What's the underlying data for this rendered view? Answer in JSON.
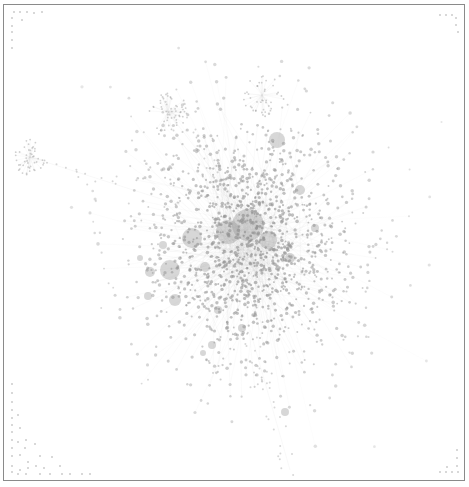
{
  "canvas": {
    "width": 469,
    "height": 487,
    "background": "#ffffff"
  },
  "frame": {
    "x": 3,
    "y": 4,
    "width": 462,
    "height": 477,
    "border_color": "#8a8a8a"
  },
  "style": {
    "node_color": "#9a9a9a",
    "edge_color": "#c8c8c8",
    "hub_color": "#8c8c8c"
  },
  "graph": {
    "type": "force-directed network",
    "main_cluster": {
      "cx": 248,
      "cy": 245,
      "rx": 140,
      "ry": 170,
      "node_count": 1400,
      "seed": 7
    },
    "satellite_clusters": [
      {
        "name": "left-cluster",
        "cx": 30,
        "cy": 157,
        "r": 18,
        "node_count": 45,
        "seed": 11
      },
      {
        "name": "upper-left-cluster",
        "cx": 168,
        "cy": 112,
        "r": 20,
        "node_count": 50,
        "seed": 13
      },
      {
        "name": "top-cluster",
        "cx": 262,
        "cy": 95,
        "r": 22,
        "node_count": 40,
        "seed": 17
      }
    ],
    "hubs": [
      {
        "x": 248,
        "y": 225,
        "r": 16
      },
      {
        "x": 228,
        "y": 232,
        "r": 12
      },
      {
        "x": 192,
        "y": 238,
        "r": 10
      },
      {
        "x": 268,
        "y": 240,
        "r": 9
      },
      {
        "x": 170,
        "y": 270,
        "r": 10
      },
      {
        "x": 150,
        "y": 272,
        "r": 5
      },
      {
        "x": 175,
        "y": 300,
        "r": 6
      },
      {
        "x": 148,
        "y": 296,
        "r": 4
      },
      {
        "x": 277,
        "y": 140,
        "r": 8
      },
      {
        "x": 300,
        "y": 190,
        "r": 5
      },
      {
        "x": 218,
        "y": 310,
        "r": 4
      },
      {
        "x": 242,
        "y": 328,
        "r": 4
      },
      {
        "x": 203,
        "y": 353,
        "r": 3
      },
      {
        "x": 212,
        "y": 345,
        "r": 4
      },
      {
        "x": 285,
        "y": 412,
        "r": 4
      },
      {
        "x": 163,
        "y": 245,
        "r": 4
      },
      {
        "x": 140,
        "y": 258,
        "r": 3
      },
      {
        "x": 290,
        "y": 258,
        "r": 5
      },
      {
        "x": 315,
        "y": 228,
        "r": 4
      },
      {
        "x": 205,
        "y": 267,
        "r": 5
      }
    ],
    "tail_paths": [
      {
        "from": [
          250,
          330
        ],
        "to": [
          290,
          470
        ],
        "count": 35,
        "seed": 23
      },
      {
        "from": [
          30,
          157
        ],
        "to": [
          180,
          205
        ],
        "count": 20,
        "seed": 29
      },
      {
        "from": [
          168,
          112
        ],
        "to": [
          220,
          180
        ],
        "count": 15,
        "seed": 31
      }
    ],
    "isolated_nodes": {
      "top_left": [
        [
          14,
          12
        ],
        [
          20,
          12
        ],
        [
          27,
          12
        ],
        [
          34,
          13
        ],
        [
          42,
          12
        ],
        [
          12,
          18
        ],
        [
          22,
          20
        ],
        [
          12,
          26
        ],
        [
          12,
          32
        ],
        [
          12,
          40
        ],
        [
          12,
          48
        ]
      ],
      "top_right": [
        [
          440,
          15
        ],
        [
          446,
          15
        ],
        [
          452,
          15
        ],
        [
          456,
          18
        ],
        [
          456,
          25
        ],
        [
          458,
          32
        ]
      ],
      "bottom_left": [
        [
          12,
          384
        ],
        [
          12,
          393
        ],
        [
          12,
          402
        ],
        [
          12,
          410
        ],
        [
          12,
          418
        ],
        [
          18,
          415
        ],
        [
          12,
          425
        ],
        [
          12,
          432
        ],
        [
          20,
          428
        ],
        [
          12,
          440
        ],
        [
          18,
          442
        ],
        [
          26,
          440
        ],
        [
          12,
          448
        ],
        [
          25,
          448
        ],
        [
          35,
          444
        ],
        [
          12,
          456
        ],
        [
          20,
          455
        ],
        [
          28,
          462
        ],
        [
          40,
          456
        ],
        [
          52,
          457
        ],
        [
          12,
          466
        ],
        [
          20,
          470
        ],
        [
          28,
          468
        ],
        [
          36,
          466
        ],
        [
          44,
          468
        ],
        [
          60,
          466
        ],
        [
          12,
          472
        ],
        [
          18,
          474
        ],
        [
          26,
          474
        ],
        [
          40,
          474
        ],
        [
          50,
          474
        ],
        [
          62,
          474
        ],
        [
          70,
          474
        ],
        [
          82,
          474
        ],
        [
          90,
          474
        ]
      ],
      "bottom_right": [
        [
          457,
          450
        ],
        [
          457,
          458
        ],
        [
          457,
          466
        ],
        [
          440,
          472
        ],
        [
          446,
          472
        ],
        [
          452,
          472
        ],
        [
          458,
          472
        ],
        [
          447,
          467
        ]
      ]
    }
  }
}
